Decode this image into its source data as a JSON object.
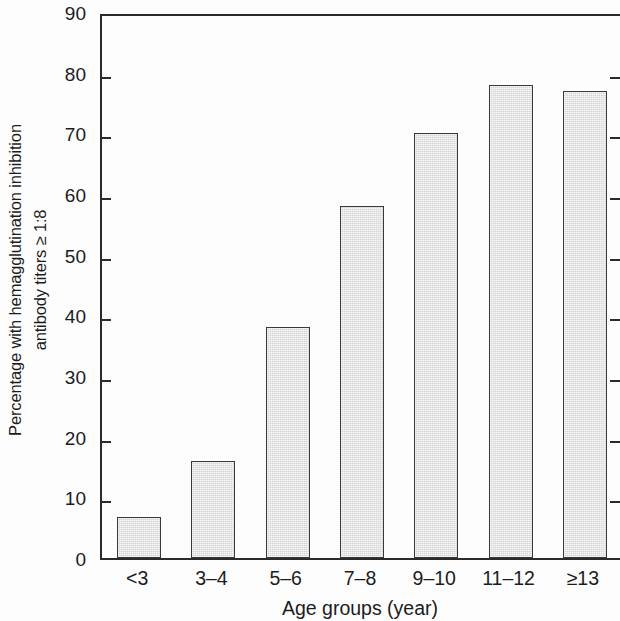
{
  "chart_data": {
    "type": "bar",
    "title": "",
    "subtitle": "",
    "categories": [
      "<3",
      "3–4",
      "5–6",
      "7–8",
      "9–10",
      "11–12",
      "≥13"
    ],
    "values": [
      6.7,
      16,
      38,
      58,
      70,
      78,
      77
    ],
    "series": [
      {
        "name": "Percentage seropositive",
        "values": [
          6.7,
          16,
          38,
          58,
          70,
          78,
          77
        ]
      }
    ],
    "xlabel": "Age groups (year)",
    "ylabel_line1": "Percentage with hemagglutination inhibition",
    "ylabel_line2": "antibody titers ≥ 1:8",
    "ylabel": "Percentage with hemagglutination inhibition antibody titers ≥ 1:8",
    "ylim": [
      0,
      90
    ],
    "ytick_values": [
      0,
      10,
      20,
      30,
      40,
      50,
      60,
      70,
      80,
      90
    ],
    "ytick_labels": [
      "0",
      "10",
      "20",
      "30",
      "40",
      "50",
      "60",
      "70",
      "80",
      "90"
    ],
    "ytick_step": 10,
    "grid": false,
    "legend": false,
    "legend_position": "none",
    "bar_fill_color": "#d4d4d4",
    "bar_edge_color": "#3a3a3a",
    "axis_color": "#2b2b2b",
    "background_color": "#ffffff"
  }
}
